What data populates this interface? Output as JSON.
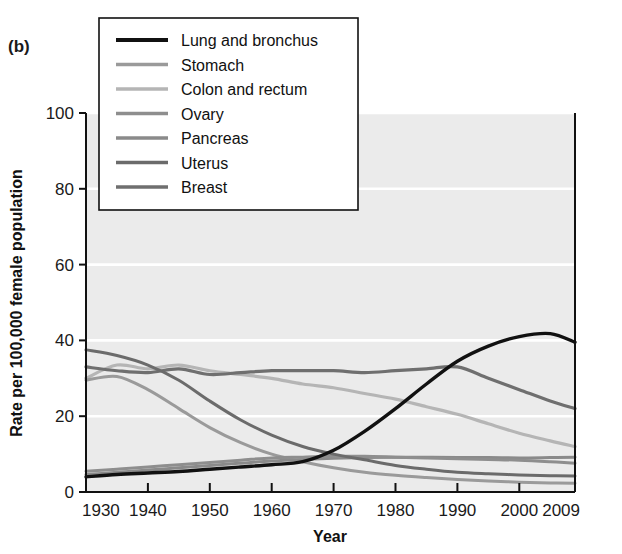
{
  "figure": {
    "panel_label": "(b)",
    "background_color": "#ffffff",
    "plot_background_color": "#ebebeb",
    "gridline_color": "#ffffff",
    "axis_color": "#111111"
  },
  "chart_data": {
    "type": "line",
    "title": "",
    "subtitle": "",
    "panel": "(b)",
    "xlabel": "Year",
    "ylabel": "Rate per 100,000 female population",
    "xlim": [
      1930,
      2009
    ],
    "ylim": [
      0,
      100
    ],
    "xticks": [
      1930,
      1940,
      1950,
      1960,
      1970,
      1980,
      1990,
      2000,
      2009
    ],
    "xtick_labels": [
      "1930",
      "1940",
      "1950",
      "1960",
      "1970",
      "1980",
      "1990",
      "2000",
      "2009"
    ],
    "yticks": [
      0,
      20,
      40,
      60,
      80,
      100
    ],
    "ytick_labels": [
      "0",
      "20",
      "40",
      "60",
      "80",
      "100"
    ],
    "grid": "horizontal",
    "legend_position": "top-left",
    "x": [
      1930,
      1935,
      1940,
      1945,
      1950,
      1955,
      1960,
      1965,
      1970,
      1975,
      1980,
      1985,
      1990,
      1995,
      2000,
      2005,
      2009
    ],
    "series": [
      {
        "name": "Lung and bronchus",
        "color": "#111111",
        "width": 3.4,
        "values": [
          4.0,
          4.6,
          5.0,
          5.4,
          6.0,
          6.6,
          7.2,
          8.0,
          11.0,
          16.0,
          22.0,
          28.5,
          34.5,
          38.5,
          41.0,
          41.8,
          39.5
        ]
      },
      {
        "name": "Stomach",
        "color": "#9a9a9a",
        "width": 3.0,
        "values": [
          29.5,
          30.5,
          27.0,
          22.0,
          17.0,
          13.0,
          10.0,
          8.0,
          6.4,
          5.2,
          4.4,
          3.8,
          3.3,
          2.9,
          2.6,
          2.4,
          2.3
        ]
      },
      {
        "name": "Colon and rectum",
        "color": "#b5b5b5",
        "width": 3.2,
        "values": [
          30.0,
          33.5,
          32.5,
          33.5,
          32.0,
          31.0,
          30.0,
          28.5,
          27.5,
          26.0,
          24.5,
          22.5,
          20.5,
          18.0,
          15.5,
          13.5,
          12.0
        ]
      },
      {
        "name": "Ovary",
        "color": "#8e8e8e",
        "width": 3.0,
        "values": [
          5.5,
          6.0,
          6.6,
          7.2,
          7.8,
          8.4,
          9.0,
          9.2,
          9.4,
          9.4,
          9.2,
          9.0,
          8.8,
          8.6,
          8.4,
          8.0,
          7.6
        ]
      },
      {
        "name": "Pancreas",
        "color": "#8a8a8a",
        "width": 3.0,
        "values": [
          4.6,
          5.2,
          5.8,
          6.4,
          7.0,
          7.6,
          8.2,
          8.6,
          8.9,
          9.1,
          9.2,
          9.2,
          9.1,
          9.1,
          9.0,
          9.1,
          9.2
        ]
      },
      {
        "name": "Uterus",
        "color": "#6b6b6b",
        "width": 3.0,
        "values": [
          37.5,
          36.0,
          33.5,
          29.5,
          24.0,
          19.0,
          15.0,
          12.0,
          10.0,
          8.5,
          7.0,
          6.0,
          5.2,
          4.8,
          4.5,
          4.3,
          4.2
        ]
      },
      {
        "name": "Breast",
        "color": "#6f6f6f",
        "width": 3.2,
        "values": [
          33.0,
          32.0,
          31.5,
          32.5,
          31.0,
          31.5,
          32.0,
          32.0,
          32.0,
          31.5,
          32.0,
          32.5,
          33.0,
          30.0,
          27.0,
          24.0,
          22.0
        ]
      }
    ]
  },
  "legend": {
    "items": [
      {
        "label": "Lung and bronchus",
        "color": "#111111"
      },
      {
        "label": "Stomach",
        "color": "#9a9a9a"
      },
      {
        "label": "Colon and rectum",
        "color": "#b5b5b5"
      },
      {
        "label": "Ovary",
        "color": "#8e8e8e"
      },
      {
        "label": "Pancreas",
        "color": "#8a8a8a"
      },
      {
        "label": "Uterus",
        "color": "#6b6b6b"
      },
      {
        "label": "Breast",
        "color": "#6f6f6f"
      }
    ]
  }
}
